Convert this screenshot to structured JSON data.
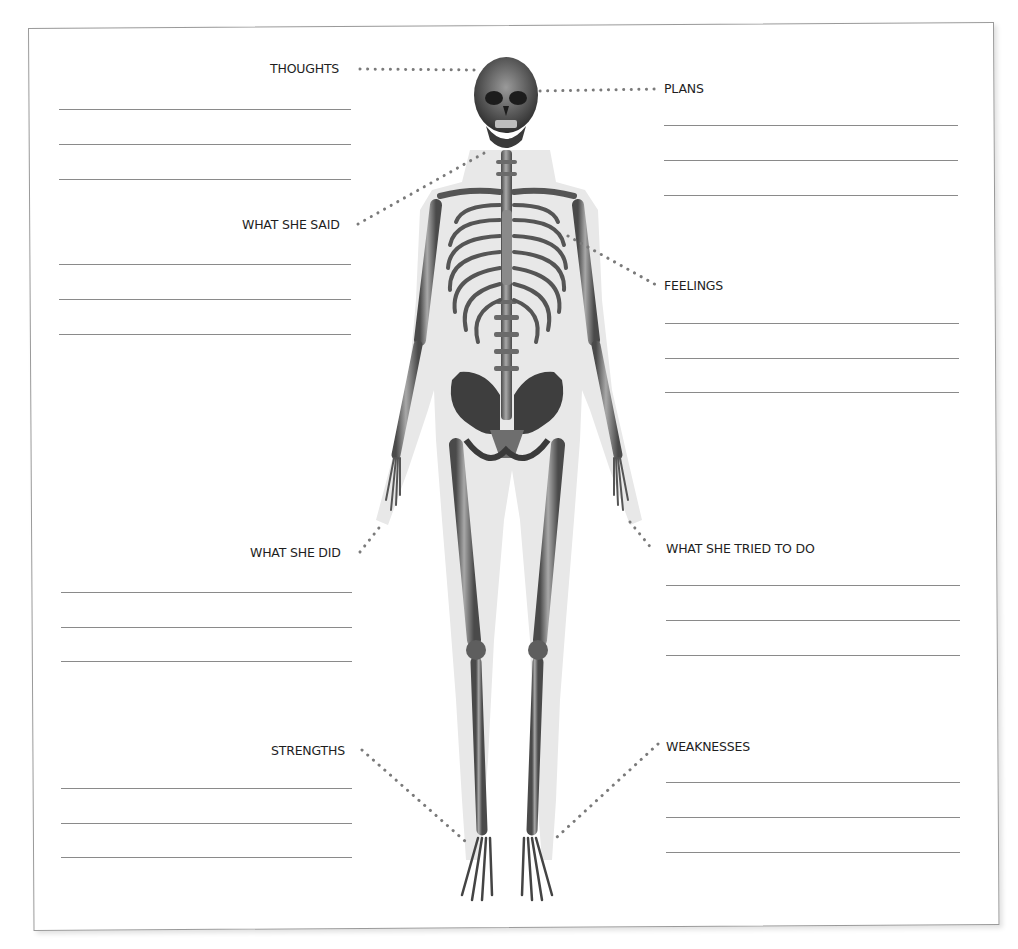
{
  "worksheet": {
    "figure": "skeleton-front-view",
    "labels": [
      {
        "id": "thoughts",
        "text": "THOUGHTS"
      },
      {
        "id": "plans",
        "text": "PLANS"
      },
      {
        "id": "what_she_said",
        "text": "WHAT SHE SAID"
      },
      {
        "id": "feelings",
        "text": "FEELINGS"
      },
      {
        "id": "what_she_did",
        "text": "WHAT SHE DID"
      },
      {
        "id": "what_she_tried_to_do",
        "text": "WHAT SHE TRIED TO DO"
      },
      {
        "id": "strengths",
        "text": "STRENGTHS"
      },
      {
        "id": "weaknesses",
        "text": "WEAKNESSES"
      }
    ],
    "lines_per_section": 3,
    "colors": {
      "border": "#9a9a9a",
      "rule_line": "#8a8a8a",
      "leader_dots": "#7a7a7a",
      "text": "#1e1e1e",
      "bone": "#8c8c8c",
      "body_silhouette": "#e6e6e6"
    }
  }
}
